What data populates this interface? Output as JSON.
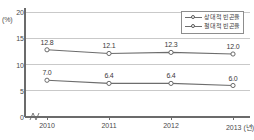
{
  "chart_data": {
    "type": "line",
    "title": "",
    "xlabel": "(년)",
    "ylabel": "(%)",
    "y_unit": "(%)",
    "x_unit": "(년)",
    "categories": [
      "2010",
      "2011",
      "2012",
      "2013"
    ],
    "x_tick_labels": [
      "2010",
      "2011",
      "2012",
      "2013 (년)"
    ],
    "y_tick_labels": [
      "0",
      "5",
      "10",
      "15",
      "20"
    ],
    "y_ticks": [
      0,
      5,
      10,
      15,
      20
    ],
    "ylim": [
      0,
      20
    ],
    "grid": true,
    "grid_axis": "y",
    "legend_position": "top-right",
    "axis_break": true,
    "series": [
      {
        "name": "상대적 빈곤율",
        "values": [
          12.8,
          12.1,
          12.3,
          12.0
        ],
        "labels": [
          "12.8",
          "12.1",
          "12.3",
          "12.0"
        ],
        "color": "#6d6d6d",
        "marker": "open-circle"
      },
      {
        "name": "절대적 빈곤율",
        "values": [
          7.0,
          6.4,
          6.4,
          6.0
        ],
        "labels": [
          "7.0",
          "6.4",
          "6.4",
          "6.0"
        ],
        "color": "#6d6d6d",
        "marker": "open-circle"
      }
    ]
  },
  "legend": {
    "items": [
      {
        "label": "상대적 빈곤율"
      },
      {
        "label": "절대적 빈곤율"
      }
    ]
  },
  "footnote": {
    "text": ""
  },
  "colors": {
    "line": "#6d6d6d",
    "axis": "#6b6b6b",
    "grid": "#c9c9c9",
    "text": "#3c3c3c",
    "background": "#ffffff"
  }
}
